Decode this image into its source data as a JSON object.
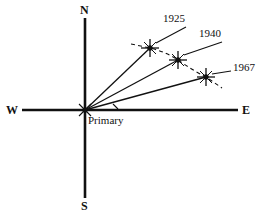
{
  "figure": {
    "background_color": "#ffffff",
    "stroke_color": "#111111",
    "width": 267,
    "height": 220
  },
  "axes": {
    "north_label": "N",
    "south_label": "S",
    "west_label": "W",
    "east_label": "E",
    "origin_label": "Primary",
    "origin": {
      "x": 85,
      "y": 110
    },
    "vertical": {
      "x": 85,
      "y1": 18,
      "y2": 198
    },
    "horizontal": {
      "y": 110,
      "x1": 22,
      "x2": 238
    }
  },
  "markers": [
    {
      "label": "1925",
      "point": {
        "x": 150,
        "y": 48
      },
      "label_position": {
        "x": 163,
        "y": 13
      },
      "leader": {
        "x1": 186,
        "y1": 27,
        "x2": 156,
        "y2": 43
      },
      "ray": {
        "x1": 85,
        "y1": 110,
        "x2": 150,
        "y2": 48
      }
    },
    {
      "label": "1940",
      "point": {
        "x": 178,
        "y": 60
      },
      "label_position": {
        "x": 199,
        "y": 28
      },
      "leader": {
        "x1": 222,
        "y1": 42,
        "x2": 184,
        "y2": 55
      },
      "ray": {
        "x1": 85,
        "y1": 110,
        "x2": 178,
        "y2": 60
      }
    },
    {
      "label": "1967",
      "point": {
        "x": 206,
        "y": 77
      },
      "label_position": {
        "x": 233,
        "y": 62
      },
      "leader": {
        "x1": 231,
        "y1": 71,
        "x2": 212,
        "y2": 74
      },
      "ray": {
        "x1": 85,
        "y1": 110,
        "x2": 206,
        "y2": 77
      }
    }
  ],
  "track_curve": {
    "style": "dashed",
    "description": "dashed curve passing through the 1925, 1940 and 1967 markers",
    "path": "M 131 44 L 150 48 Q 166 52 178 60 Q 192 70 206 77 L 222 88"
  },
  "angle_tick": {
    "description": "small tick on the east axis marking the swept angle",
    "path": "M 113 104 L 118 109"
  }
}
